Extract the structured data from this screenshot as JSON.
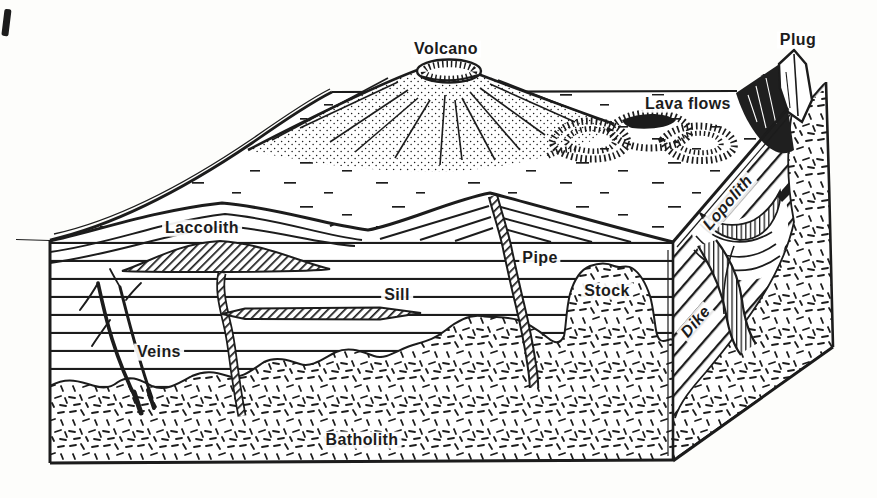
{
  "figure": {
    "colors": {
      "ink": "#1c1c1c",
      "paper": "#fdfdfb"
    },
    "labels": {
      "volcano": "Volcano",
      "plug": "Plug",
      "lava_flows": "Lava flows",
      "laccolith": "Laccolith",
      "lopolith": "Lopolith",
      "pipe": "Pipe",
      "stock": "Stock",
      "dike": "Dike",
      "sill": "Sill",
      "veins": "Veins",
      "batholith": "Batholith"
    }
  }
}
